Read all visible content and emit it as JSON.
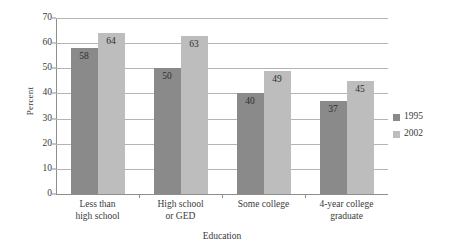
{
  "chart_data": {
    "type": "bar",
    "title": "",
    "xlabel": "Education",
    "ylabel": "Percent",
    "categories": [
      "Less than\nhigh school",
      "High school\nor GED",
      "Some college",
      "4-year college\ngraduate"
    ],
    "category_lines": [
      [
        "Less than",
        "high school"
      ],
      [
        "High school",
        "or GED"
      ],
      [
        "Some college",
        ""
      ],
      [
        "4-year college",
        "graduate"
      ]
    ],
    "series": [
      {
        "name": "1995",
        "values": [
          58,
          50,
          40,
          37
        ],
        "color": "#8a8a8a"
      },
      {
        "name": "2002",
        "values": [
          64,
          63,
          49,
          45
        ],
        "color": "#bdbdbd"
      }
    ],
    "ylim": [
      0,
      70
    ],
    "ytick_labels": [
      "0",
      "10",
      "20",
      "30",
      "40",
      "50",
      "60",
      "70"
    ],
    "ytick_values": [
      0,
      10,
      20,
      30,
      40,
      50,
      60,
      70
    ],
    "grid": true,
    "legend_position": "right",
    "legend_entries": [
      "1995",
      "2002"
    ]
  },
  "axis": {
    "y_title": "Percent",
    "x_title": "Education"
  },
  "colors": {
    "series_1995": "#8a8a8a",
    "series_2002": "#bdbdbd",
    "gridline": "#b4b4b4",
    "axis": "#8e8e8e",
    "text": "#3a3a3a",
    "background": "#ffffff"
  }
}
